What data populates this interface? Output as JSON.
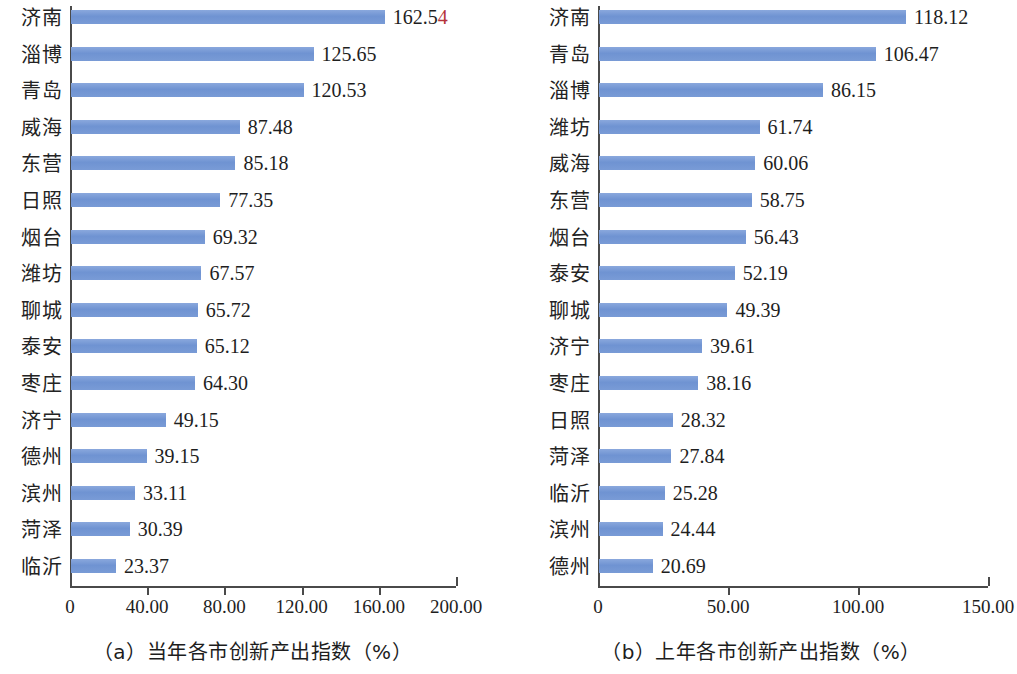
{
  "chart_data": [
    {
      "type": "bar",
      "orientation": "horizontal",
      "panel_id": "a",
      "title": "",
      "caption": "（a）当年各市创新产出指数（%）",
      "xlabel": "",
      "ylabel": "",
      "xlim": [
        0,
        200
      ],
      "xticks": [
        0,
        40,
        80,
        120,
        160,
        200
      ],
      "xtick_labels": [
        "0",
        "40.00",
        "80.00",
        "120.00",
        "160.00",
        "200.00"
      ],
      "grid": false,
      "legend": false,
      "bar_color": "#6f93d2",
      "categories": [
        "济南",
        "淄博",
        "青岛",
        "威海",
        "东营",
        "日照",
        "烟台",
        "潍坊",
        "聊城",
        "泰安",
        "枣庄",
        "济宁",
        "德州",
        "滨州",
        "菏泽",
        "临沂"
      ],
      "values": [
        162.54,
        125.65,
        120.53,
        87.48,
        85.18,
        77.35,
        69.32,
        67.57,
        65.72,
        65.12,
        64.3,
        49.15,
        39.15,
        33.11,
        30.39,
        23.37
      ],
      "value_labels": [
        "162.54",
        "125.65",
        "120.53",
        "87.48",
        "85.18",
        "77.35",
        "69.32",
        "67.57",
        "65.72",
        "65.12",
        "64.30",
        "49.15",
        "39.15",
        "33.11",
        "30.39",
        "23.37"
      ]
    },
    {
      "type": "bar",
      "orientation": "horizontal",
      "panel_id": "b",
      "title": "",
      "caption": "（b）上年各市创新产出指数（%）",
      "xlabel": "",
      "ylabel": "",
      "xlim": [
        0,
        150
      ],
      "xticks": [
        0,
        50,
        100,
        150
      ],
      "xtick_labels": [
        "0",
        "50.00",
        "100.00",
        "150.00"
      ],
      "grid": false,
      "legend": false,
      "bar_color": "#6f93d2",
      "categories": [
        "济南",
        "青岛",
        "淄博",
        "潍坊",
        "威海",
        "东营",
        "烟台",
        "泰安",
        "聊城",
        "济宁",
        "枣庄",
        "日照",
        "菏泽",
        "临沂",
        "滨州",
        "德州"
      ],
      "values": [
        118.12,
        106.47,
        86.15,
        61.74,
        60.06,
        58.75,
        56.43,
        52.19,
        49.39,
        39.61,
        38.16,
        28.32,
        27.84,
        25.28,
        24.44,
        20.69
      ],
      "value_labels": [
        "118.12",
        "106.47",
        "86.15",
        "61.74",
        "60.06",
        "58.75",
        "56.43",
        "52.19",
        "49.39",
        "39.61",
        "38.16",
        "28.32",
        "27.84",
        "25.28",
        "24.44",
        "20.69"
      ]
    }
  ]
}
